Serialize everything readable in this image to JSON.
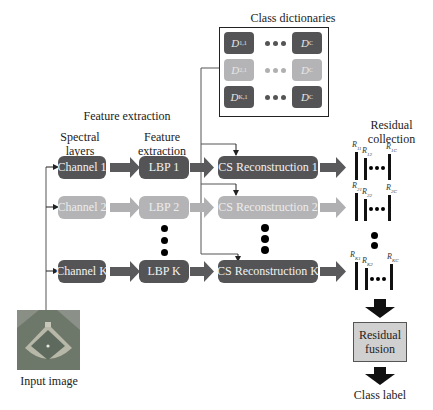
{
  "titles": {
    "class_dictionaries": "Class dictionaries",
    "feature_extraction_group": "Feature extraction",
    "spectral_layers": "Spectral layers",
    "feature_extraction_col": "Feature extraction",
    "residual_collection": "Residual collection",
    "input_image": "Input image",
    "class_label": "Class label"
  },
  "dictionaries": {
    "rows": [
      {
        "first": "D",
        "first_sub": "1,1",
        "last": "D",
        "last_sub": "C",
        "shade": "dark"
      },
      {
        "first": "D",
        "first_sub": "2,1",
        "last": "D",
        "last_sub": "C",
        "shade": "light"
      },
      {
        "first": "D",
        "first_sub": "K,1",
        "last": "D",
        "last_sub": "C",
        "shade": "dark"
      }
    ]
  },
  "pipeline": {
    "rows": [
      {
        "channel": "Channel 1",
        "lbp": "LBP 1",
        "cs": "CS Reconstruction 1",
        "shade": "dark",
        "residuals": {
          "r1": "11",
          "r2": "12",
          "rc": "1C"
        }
      },
      {
        "channel": "Channel 2",
        "lbp": "LBP 2",
        "cs": "CS Reconstruction 2",
        "shade": "light",
        "residuals": {
          "r1": "21",
          "r2": "22",
          "rc": "2C"
        }
      },
      {
        "channel": "Channel K",
        "lbp": "LBP K",
        "cs": "CS Reconstruction K",
        "shade": "dark",
        "residuals": {
          "r1": "K1",
          "r2": "K2",
          "rc": "KC"
        }
      }
    ]
  },
  "fusion": {
    "label": "Residual fusion"
  },
  "residual_symbol": "R",
  "colors": {
    "dark": "#545456",
    "light": "#b4b4b6",
    "arrow_dark": "#5a5a5c",
    "arrow_light": "#b0b0b2",
    "fusion_bg": "#d0d0d0"
  }
}
